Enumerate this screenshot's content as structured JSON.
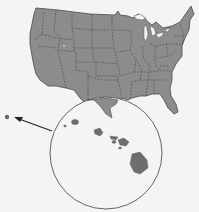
{
  "map": {
    "subject": "United States with Hawaii inset",
    "land_color": "#8c8c8c",
    "border_color": "#555555",
    "background_color": "#f4f4f2",
    "water_color": "#f4f4f2",
    "outline_color": "#444444"
  },
  "inset": {
    "label": "",
    "region": "Hawaii",
    "circle_stroke": "#555555"
  },
  "pointer": {
    "target": "Hawaii location marker"
  }
}
